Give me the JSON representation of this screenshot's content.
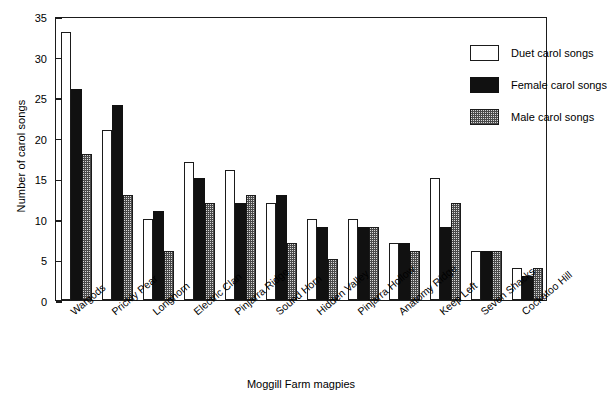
{
  "chart_data": {
    "type": "bar",
    "title": "",
    "xlabel": "Moggill Farm magpies",
    "ylabel": "Number of carol songs",
    "ylim": [
      0,
      35
    ],
    "yticks": [
      0,
      5,
      10,
      15,
      20,
      25,
      30,
      35
    ],
    "grid": false,
    "legend_position": "top-right inside axes",
    "categories": [
      "Wargods",
      "Prickly Pear",
      "Longhorn",
      "Electric Clan",
      "Pinjarra Ridge",
      "Sound Horn",
      "Hidden Valley",
      "Pinjarra Hollow",
      "Anatomy Ridge",
      "Keep Left",
      "Seven Shacks",
      "Cockatoo Hill"
    ],
    "series": [
      {
        "name": "Duet carol songs",
        "fill": "white",
        "color": "#ffffff",
        "values": [
          33,
          21,
          10,
          17,
          16,
          12,
          10,
          10,
          7,
          15,
          6,
          4
        ]
      },
      {
        "name": "Female carol songs",
        "fill": "black",
        "color": "#111111",
        "values": [
          26,
          24,
          11,
          15,
          12,
          13,
          9,
          9,
          7,
          9,
          6,
          3
        ]
      },
      {
        "name": "Male carol songs",
        "fill": "stipple-gray",
        "color": "#d8d8d8",
        "values": [
          18,
          13,
          6,
          12,
          13,
          7,
          5,
          9,
          6,
          12,
          6,
          4
        ]
      }
    ]
  },
  "legend": {
    "entries": [
      {
        "label": "Duet carol songs",
        "swatch": "white-square"
      },
      {
        "label": "Female carol songs",
        "swatch": "black-square"
      },
      {
        "label": "Male carol songs",
        "swatch": "stipple-square"
      }
    ]
  }
}
